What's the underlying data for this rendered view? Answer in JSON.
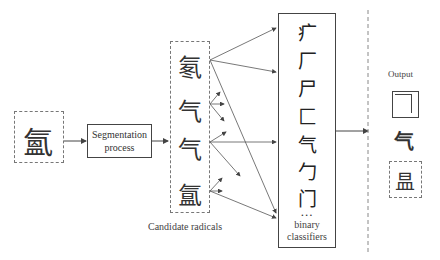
{
  "input": {
    "character": "氳",
    "label": ""
  },
  "segmentation": {
    "label_line1": "Segmentation",
    "label_line2": "process"
  },
  "candidates": {
    "label": "Candidate radicals",
    "items": [
      "氡",
      "气",
      "气",
      "氲"
    ]
  },
  "classifiers": {
    "radicals": [
      "疒",
      "厂",
      "尸",
      "匚",
      "气",
      "勹",
      "门"
    ],
    "ellipsis": "...",
    "label_line1": "binary",
    "label_line2": "classifiers"
  },
  "output": {
    "title": "Output",
    "structure_icon": "top-left-enclosure-structure",
    "radical": "气",
    "remainder": "昷"
  },
  "colors": {
    "line": "#444444",
    "dashed": "#777777",
    "background": "#ffffff"
  }
}
